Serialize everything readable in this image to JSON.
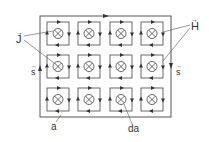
{
  "diagram": {
    "labels": {
      "J": "J",
      "H": "H",
      "s_left": "s",
      "s_right": "s",
      "a": "a",
      "da": "da"
    },
    "grid": {
      "rows": 3,
      "cols": 4
    },
    "symbol": "current-into-page (⊗)",
    "colors": {
      "line": "#333333",
      "background": "#ffffff"
    }
  }
}
